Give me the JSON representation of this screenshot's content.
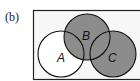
{
  "figure": {
    "panel_label": "(b)",
    "sets": [
      {
        "name": "A",
        "cx": 61,
        "cy": 54,
        "r": 23,
        "label_x": 57,
        "label_y": 62
      },
      {
        "name": "B",
        "cx": 87,
        "cy": 37,
        "r": 23,
        "label_x": 82,
        "label_y": 40
      },
      {
        "name": "C",
        "cx": 113,
        "cy": 54,
        "r": 23,
        "label_x": 108,
        "label_y": 62
      }
    ],
    "shaded_region": "B ∪ C",
    "colors": {
      "shade": "#8c8c8c",
      "stroke": "#111111",
      "background": "#ffffff"
    }
  }
}
